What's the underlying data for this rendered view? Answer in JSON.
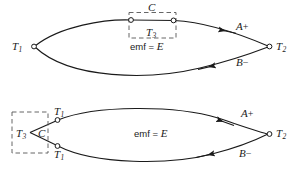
{
  "figure": {
    "background_color": "#ffffff",
    "line_color": "#1a1a1a",
    "dash_color": "#555555",
    "node_fill": "#ffffff"
  },
  "top_diagram": {
    "name": "thermocouple-with-interposed-metal-in-one-leg",
    "left_junction_label": "T",
    "left_junction_sub": "1",
    "right_junction_label": "T",
    "right_junction_sub": "2",
    "box_label": "C",
    "box_temp_label": "T",
    "box_temp_sub": "3",
    "emf_text": "emf = ",
    "emf_symbol": "E",
    "upper_branch_label": "A",
    "upper_branch_sign": "+",
    "lower_branch_label": "B",
    "lower_branch_sign": "−"
  },
  "bottom_diagram": {
    "name": "thermocouple-with-interposed-metal-at-junction",
    "left_upper_junction_label": "T",
    "left_upper_junction_sub": "1",
    "left_lower_junction_label": "T",
    "left_lower_junction_sub": "1",
    "right_junction_label": "T",
    "right_junction_sub": "2",
    "box_temp_label": "T",
    "box_temp_sub": "3",
    "box_label": "C",
    "emf_text": "emf = ",
    "emf_symbol": "E",
    "upper_branch_label": "A",
    "upper_branch_sign": "+",
    "lower_branch_label": "B",
    "lower_branch_sign": "−"
  }
}
